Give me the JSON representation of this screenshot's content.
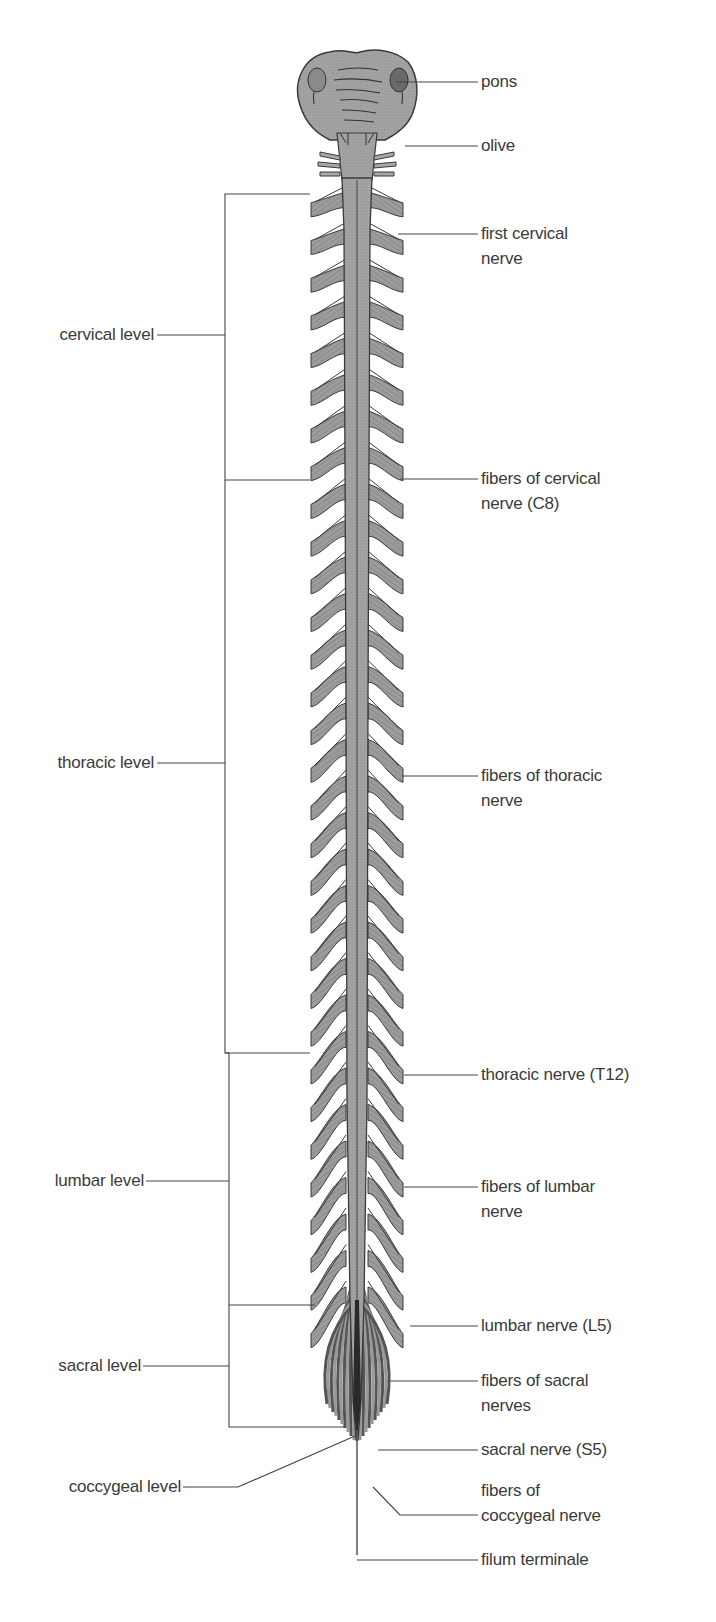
{
  "diagram": {
    "colors": {
      "background": "#ffffff",
      "tissue": "#9a9a9a",
      "tissue_light": "#b4b4b4",
      "outline": "#3a3a3a",
      "leader_line": "#444444",
      "text": "#3a3a3a"
    },
    "left_labels": [
      {
        "id": "cervical",
        "text": "cervical level"
      },
      {
        "id": "thoracic",
        "text": "thoracic level"
      },
      {
        "id": "lumbar",
        "text": "lumbar level"
      },
      {
        "id": "sacral",
        "text": "sacral level"
      },
      {
        "id": "coccygeal",
        "text": "coccygeal level"
      }
    ],
    "right_labels": [
      {
        "id": "pons",
        "line1": "pons",
        "line2": ""
      },
      {
        "id": "olive",
        "line1": "olive",
        "line2": ""
      },
      {
        "id": "first-cervical",
        "line1": "first cervical",
        "line2": "nerve"
      },
      {
        "id": "c8",
        "line1": "fibers of cervical",
        "line2": "nerve (C8)"
      },
      {
        "id": "thoracic-fibers",
        "line1": "fibers of thoracic",
        "line2": "nerve"
      },
      {
        "id": "t12",
        "line1": "thoracic nerve (T12)",
        "line2": ""
      },
      {
        "id": "lumbar-fibers",
        "line1": "fibers of lumbar",
        "line2": "nerve"
      },
      {
        "id": "l5",
        "line1": "lumbar nerve (L5)",
        "line2": ""
      },
      {
        "id": "sacral-fibers",
        "line1": "fibers of sacral",
        "line2": "nerves"
      },
      {
        "id": "s5",
        "line1": "sacral nerve (S5)",
        "line2": ""
      },
      {
        "id": "coccygeal-fibers",
        "line1": "fibers of",
        "line2": "coccygeal nerve"
      },
      {
        "id": "filum",
        "line1": "filum terminale",
        "line2": ""
      }
    ]
  }
}
